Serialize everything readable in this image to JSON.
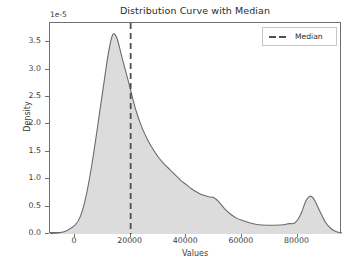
{
  "chart_data": {
    "type": "area",
    "title": "Distribution Curve with Median",
    "xlabel": "Values",
    "ylabel": "Density",
    "y_offset_text": "1e-5",
    "xlim": [
      -9000,
      96000
    ],
    "ylim": [
      0,
      3.85
    ],
    "y_scale_factor": 1e-05,
    "grid": false,
    "legend": {
      "position": "upper right",
      "entries": [
        {
          "label": "Median",
          "style": "dashed",
          "color": "#4f4f4f"
        }
      ]
    },
    "xticks": [
      0,
      20000,
      40000,
      60000,
      80000
    ],
    "xtick_labels": [
      "0",
      "20000",
      "40000",
      "60000",
      "80000"
    ],
    "yticks": [
      0.0,
      0.5,
      1.0,
      1.5,
      2.0,
      2.5,
      3.0,
      3.5
    ],
    "ytick_labels": [
      "0.0",
      "0.5",
      "1.0",
      "1.5",
      "2.0",
      "2.5",
      "3.0",
      "3.5"
    ],
    "median_value": 20000,
    "series": [
      {
        "name": "Density",
        "fill_color": "#dcdcdc",
        "line_color": "#6b6b6b",
        "x": [
          -9000,
          -6000,
          -3000,
          0,
          2000,
          4000,
          6000,
          8000,
          10000,
          12000,
          13500,
          15000,
          17000,
          19000,
          20000,
          22000,
          24000,
          26000,
          28000,
          30000,
          32000,
          34000,
          36000,
          38000,
          40000,
          42000,
          44000,
          46000,
          48000,
          50000,
          52000,
          54000,
          56000,
          58000,
          60000,
          63000,
          66000,
          69000,
          72000,
          75000,
          77000,
          79000,
          81000,
          83000,
          84500,
          86000,
          88000,
          90000,
          92000,
          94000,
          96000
        ],
        "y": [
          0.01,
          0.02,
          0.06,
          0.16,
          0.33,
          0.7,
          1.25,
          1.92,
          2.62,
          3.3,
          3.63,
          3.58,
          3.2,
          2.82,
          2.62,
          2.24,
          1.95,
          1.73,
          1.55,
          1.4,
          1.28,
          1.18,
          1.08,
          0.98,
          0.9,
          0.82,
          0.76,
          0.71,
          0.68,
          0.66,
          0.57,
          0.45,
          0.36,
          0.29,
          0.25,
          0.2,
          0.17,
          0.16,
          0.16,
          0.17,
          0.19,
          0.2,
          0.34,
          0.6,
          0.69,
          0.63,
          0.42,
          0.22,
          0.1,
          0.04,
          0.02
        ]
      }
    ]
  },
  "chart": {
    "title": "Distribution Curve with Median",
    "offset_text": "1e-5",
    "xlabel": "Values",
    "ylabel": "Density",
    "legend_label": "Median"
  }
}
